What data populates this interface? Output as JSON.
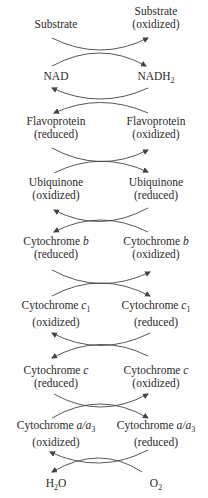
{
  "diagram": {
    "rows": [
      {
        "left": {
          "name": "Substrate",
          "state": ""
        },
        "right": {
          "name": "Substrate",
          "state": "(oxidized)"
        }
      },
      {
        "left": {
          "name": "NAD",
          "state": ""
        },
        "right": {
          "name": "NADH",
          "sub": "2",
          "state": ""
        }
      },
      {
        "left": {
          "name": "Flavoprotein",
          "state": "(reduced)"
        },
        "right": {
          "name": "Flavoprotein",
          "state": "(oxidized)"
        }
      },
      {
        "left": {
          "name": "Ubiquinone",
          "state": "(oxidized)"
        },
        "right": {
          "name": "Ubiquinone",
          "state": "(reduced)"
        }
      },
      {
        "left": {
          "name": "Cytochrome ",
          "italic": "b",
          "state": "(reduced)"
        },
        "right": {
          "name": "Cytochrome ",
          "italic": "b",
          "state": "(oxidized)"
        }
      },
      {
        "left": {
          "name": "Cytochrome ",
          "italic": "c",
          "sub": "1",
          "state": "(oxidized)"
        },
        "right": {
          "name": "Cytochrome ",
          "italic": "c",
          "sub": "1",
          "state": "(reduced)"
        }
      },
      {
        "left": {
          "name": "Cytochrome ",
          "italic": "c",
          "state": "(reduced)"
        },
        "right": {
          "name": "Cytochrome ",
          "italic": "c",
          "state": "(oxidized)"
        }
      },
      {
        "left": {
          "name": "Cytochrome ",
          "italic": "a/a",
          "sub": "3",
          "state": "(oxidized)"
        },
        "right": {
          "name": "Cytochrome ",
          "italic": "a/a",
          "sub": "3",
          "state": "(reduced)"
        }
      },
      {
        "left": {
          "name": "H",
          "sub": "2",
          "tail": "O",
          "state": ""
        },
        "right": {
          "name": "O",
          "sub": "2",
          "state": ""
        }
      }
    ],
    "arrow_color": "#444444",
    "text_color": "#2a2a2a"
  }
}
